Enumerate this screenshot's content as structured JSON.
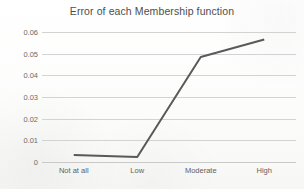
{
  "chart_data": {
    "type": "line",
    "title": "Error of each Membership function",
    "xlabel": "",
    "ylabel": "",
    "categories": [
      "Not at all",
      "Low",
      "Moderate",
      "High"
    ],
    "series": [
      {
        "name": "Error",
        "values": [
          0.0032,
          0.0023,
          0.0485,
          0.0565
        ],
        "color": "#595959",
        "line_width": 2,
        "markers": false
      }
    ],
    "ylim": [
      0,
      0.06
    ],
    "ytick_labels": [
      "0.06",
      "0.05",
      "0.04",
      "0.03",
      "0.02",
      "0.01",
      "0"
    ],
    "ytick_values": [
      0.06,
      0.05,
      0.04,
      0.03,
      0.02,
      0.01,
      0
    ],
    "grid": true,
    "grid_color": "#d3d3d3",
    "legend": false,
    "legend_position": "none",
    "plot_background": "#ffffff",
    "title_color": "#4d4d4d"
  }
}
